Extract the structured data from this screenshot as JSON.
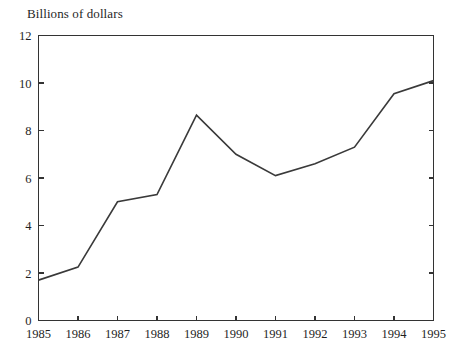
{
  "chart_data": {
    "type": "line",
    "title": "Billions of dollars",
    "xlabel": "",
    "ylabel": "",
    "x": [
      1985,
      1986,
      1987,
      1988,
      1989,
      1990,
      1991,
      1992,
      1993,
      1994,
      1995
    ],
    "categories": [
      "1985",
      "1986",
      "1987",
      "1988",
      "1989",
      "1990",
      "1991",
      "1992",
      "1993",
      "1994",
      "1995"
    ],
    "values": [
      1.7,
      2.25,
      5.0,
      5.3,
      8.65,
      7.0,
      6.1,
      6.6,
      7.3,
      9.55,
      10.1
    ],
    "series": [
      {
        "name": "Billions of dollars",
        "values": [
          1.7,
          2.25,
          5.0,
          5.3,
          8.65,
          7.0,
          6.1,
          6.6,
          7.3,
          9.55,
          10.1
        ]
      }
    ],
    "xlim": [
      1985,
      1995
    ],
    "ylim": [
      0,
      12
    ],
    "ytick_labels": [
      "0",
      "2",
      "4",
      "6",
      "8",
      "10",
      "12"
    ],
    "ytick_values": [
      0,
      2,
      4,
      6,
      8,
      10,
      12
    ],
    "xtick_labels": [
      "1985",
      "1986",
      "1987",
      "1988",
      "1989",
      "1990",
      "1991",
      "1992",
      "1993",
      "1994",
      "1995"
    ],
    "grid": false,
    "legend": false,
    "legend_position": "none",
    "line_color": "#3a3a3a",
    "axis_color": "#333333",
    "background_color": "#ffffff"
  }
}
